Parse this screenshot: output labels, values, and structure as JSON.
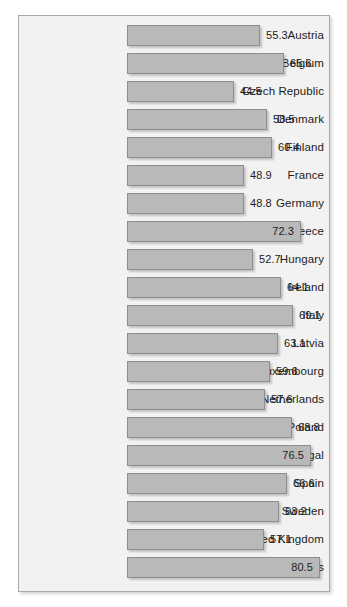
{
  "frame": {
    "background_color": "#f2f2f2",
    "border_color": "#a9a9a9"
  },
  "bar_style": {
    "fill_color": "#b9b9b9",
    "border_color": "#8e8e8e",
    "label_color": "#1c1c1c"
  },
  "chart_data": {
    "type": "bar",
    "orientation": "horizontal",
    "title": "",
    "subtitle": "",
    "xlabel": "",
    "ylabel": "",
    "grid": false,
    "legend": null,
    "xlim": [
      0,
      80.5
    ],
    "value_labels_shown": true,
    "categories": [
      "Austria",
      "Belgium",
      "Czech Republic",
      "Denmark",
      "Finland",
      "France",
      "Germany",
      "Greece",
      "Hungary",
      "Ireland",
      "Italy",
      "Latvia",
      "Luxembourg",
      "Netherlands",
      "Poland",
      "Portugal",
      "Spain",
      "Sweden",
      "United Kingdom",
      "United States"
    ],
    "values": [
      55.3,
      65.6,
      44.5,
      58.5,
      60.4,
      48.9,
      48.8,
      72.3,
      52.7,
      64.1,
      69.1,
      63.1,
      59.6,
      57.6,
      68.8,
      76.5,
      66.6,
      63.2,
      57.1,
      80.5
    ],
    "value_label_text": [
      "55.3",
      "65.6",
      "44.5",
      "58.5",
      "60.4",
      "48.9",
      "48.8",
      "72.3",
      "52.7",
      "64.1",
      "69.1",
      "63.1",
      "59.6",
      "57.6",
      "68.8",
      "76.5",
      "66.6",
      "63.2",
      "57.1",
      "80.5"
    ],
    "value_label_placement": [
      "outside",
      "outside",
      "outside",
      "outside",
      "outside",
      "outside",
      "outside",
      "inside",
      "outside",
      "outside",
      "outside",
      "outside",
      "outside",
      "outside",
      "outside",
      "inside",
      "outside",
      "outside",
      "outside",
      "inside"
    ]
  }
}
